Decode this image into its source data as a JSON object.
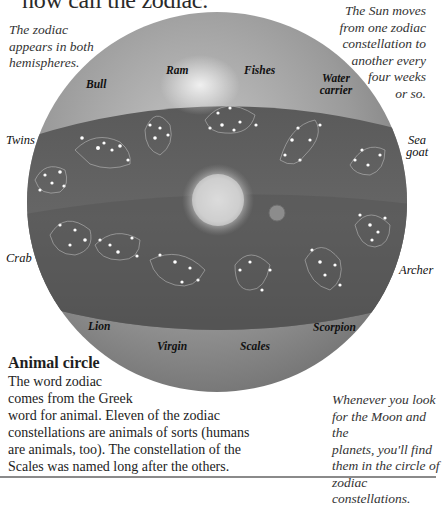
{
  "title": "now call the zodiac.",
  "notes": {
    "left": "The zodiac appears in both hemispheres.",
    "right_lines": [
      "The Sun moves",
      "from one zodiac",
      "constellation to",
      "another every",
      "four weeks",
      "or so."
    ],
    "bottom_right_lines": [
      "Whenever you look",
      "for the Moon and the",
      "planets, you'll find",
      "them in the circle of",
      "zodiac constellations."
    ]
  },
  "constellation_labels": {
    "bull": "Bull",
    "ram": "Ram",
    "fishes": "Fishes",
    "water_carrier_1": "Water",
    "water_carrier_2": "carrier",
    "twins": "Twins",
    "sea_goat_1": "Sea",
    "sea_goat_2": "goat",
    "crab": "Crab",
    "archer": "Archer",
    "lion": "Lion",
    "virgin": "Virgin",
    "scales": "Scales",
    "scorpion": "Scorpion"
  },
  "section": {
    "heading": "Animal circle",
    "lines": [
      "The word zodiac",
      "comes from the Greek",
      "word for animal. Eleven of the zodiac",
      "constellations are animals of sorts (humans",
      "are animals, too). The constellation of the",
      "Scales was named long after the others."
    ]
  },
  "colors": {
    "sphere_light": "#b8b8b8",
    "sphere_mid": "#8e8e8e",
    "band": "#5e5e5e",
    "band_dark": "#4a4a4a",
    "star": "#ffffff"
  }
}
